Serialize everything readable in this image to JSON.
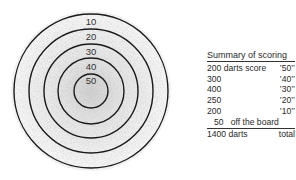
{
  "target": {
    "rings": [
      {
        "label": "10",
        "radius": 77
      },
      {
        "label": "20",
        "radius": 62
      },
      {
        "label": "30",
        "radius": 47
      },
      {
        "label": "40",
        "radius": 33
      },
      {
        "label": "50",
        "radius": 17
      }
    ],
    "ring_color": "#1a1a1a"
  },
  "summary": {
    "title": "Summary of scoring",
    "rows": [
      {
        "count": "200",
        "desc": "darts score",
        "score": "’50’’"
      },
      {
        "count": "300",
        "desc": "",
        "score": "’40’’"
      },
      {
        "count": "400",
        "desc": "",
        "score": "’30’’"
      },
      {
        "count": "250",
        "desc": "",
        "score": "’20’’"
      },
      {
        "count": "200",
        "desc": "",
        "score": "’10’’"
      },
      {
        "count": "50",
        "desc": "off the board",
        "score": ""
      }
    ],
    "total": {
      "count": "1400 darts",
      "label": "total"
    }
  }
}
